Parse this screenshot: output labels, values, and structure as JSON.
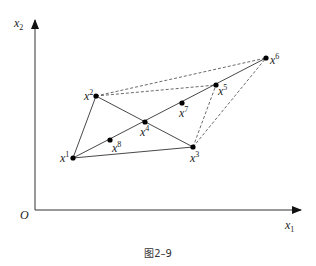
{
  "figure": {
    "caption": "图2–9",
    "axes": {
      "x_label": "x",
      "x_label_sub": "1",
      "y_label": "x",
      "y_label_sub": "2",
      "origin_label": "O"
    },
    "points": [
      {
        "id": "x1",
        "base": "x",
        "sup": "1",
        "x": 73,
        "y": 158
      },
      {
        "id": "x2",
        "base": "x",
        "sup": "2",
        "x": 96,
        "y": 96
      },
      {
        "id": "x3",
        "base": "x",
        "sup": "3",
        "x": 193,
        "y": 147
      },
      {
        "id": "x4",
        "base": "x",
        "sup": "4",
        "x": 145,
        "y": 122
      },
      {
        "id": "x5",
        "base": "x",
        "sup": "5",
        "x": 216,
        "y": 85
      },
      {
        "id": "x6",
        "base": "x",
        "sup": "6",
        "x": 266,
        "y": 58
      },
      {
        "id": "x7",
        "base": "x",
        "sup": "7",
        "x": 182,
        "y": 103
      },
      {
        "id": "x8",
        "base": "x",
        "sup": "8",
        "x": 110,
        "y": 140
      }
    ],
    "solid_edges": [
      [
        "x1",
        "x2"
      ],
      [
        "x2",
        "x3"
      ],
      [
        "x1",
        "x3"
      ],
      [
        "x1",
        "x6"
      ]
    ],
    "dashed_edges": [
      [
        "x2",
        "x6"
      ],
      [
        "x2",
        "x5"
      ],
      [
        "x3",
        "x5"
      ],
      [
        "x3",
        "x6"
      ]
    ],
    "colors": {
      "line": "#333333",
      "point": "#000000",
      "background": "#ffffff"
    }
  }
}
